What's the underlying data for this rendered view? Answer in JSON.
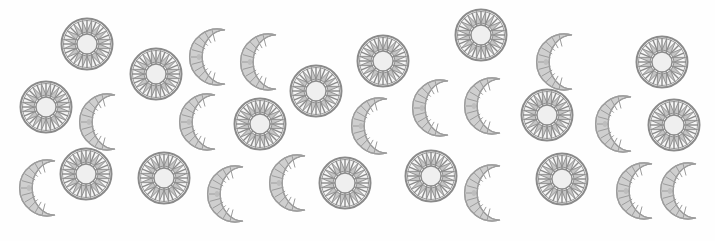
{
  "scene": {
    "description": "Scattered gray sun and crescent-moon mandala ornaments on a white background",
    "background": "#fefefe",
    "colors": {
      "sun_stroke": "#8a8a8a",
      "sun_fill": "#c4c4c4",
      "sun_center": "#efefef",
      "moon_stroke": "#9c9c9c",
      "moon_fill": "#cfcfcf"
    },
    "suns": [
      {
        "x": 87,
        "y": 44
      },
      {
        "x": 156,
        "y": 74
      },
      {
        "x": 316,
        "y": 91
      },
      {
        "x": 383,
        "y": 61
      },
      {
        "x": 481,
        "y": 35
      },
      {
        "x": 547,
        "y": 115
      },
      {
        "x": 662,
        "y": 62
      },
      {
        "x": 674,
        "y": 125
      },
      {
        "x": 46,
        "y": 107
      },
      {
        "x": 260,
        "y": 124
      },
      {
        "x": 86,
        "y": 174
      },
      {
        "x": 164,
        "y": 178
      },
      {
        "x": 345,
        "y": 183
      },
      {
        "x": 431,
        "y": 176
      },
      {
        "x": 562,
        "y": 179
      }
    ],
    "moons": [
      {
        "x": 210,
        "y": 57
      },
      {
        "x": 261,
        "y": 62
      },
      {
        "x": 100,
        "y": 122
      },
      {
        "x": 200,
        "y": 122
      },
      {
        "x": 372,
        "y": 126
      },
      {
        "x": 433,
        "y": 108
      },
      {
        "x": 485,
        "y": 106
      },
      {
        "x": 557,
        "y": 62
      },
      {
        "x": 616,
        "y": 124
      },
      {
        "x": 40,
        "y": 188
      },
      {
        "x": 228,
        "y": 194
      },
      {
        "x": 290,
        "y": 183
      },
      {
        "x": 485,
        "y": 193
      },
      {
        "x": 637,
        "y": 191
      },
      {
        "x": 681,
        "y": 191
      }
    ]
  }
}
